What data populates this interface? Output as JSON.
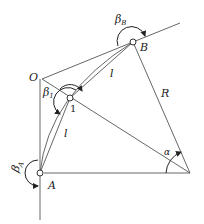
{
  "diagram": {
    "points": {
      "O": {
        "label": "O",
        "x": 42,
        "y": 79
      },
      "A": {
        "label": "A",
        "x": 40,
        "y": 173
      },
      "P1": {
        "label": "1",
        "x": 70,
        "y": 98
      },
      "B": {
        "label": "B",
        "x": 133,
        "y": 42
      },
      "C": {
        "x": 190,
        "y": 173
      }
    },
    "labels": {
      "O": "O",
      "A": "A",
      "B": "B",
      "one": "1",
      "R": "R",
      "l_upper": "l",
      "l_lower": "l",
      "alpha": "α",
      "beta": "β",
      "beta_B_sub": "B",
      "beta_1_sub": "1",
      "beta_A_sub": "A"
    },
    "line_color": "#555555"
  }
}
